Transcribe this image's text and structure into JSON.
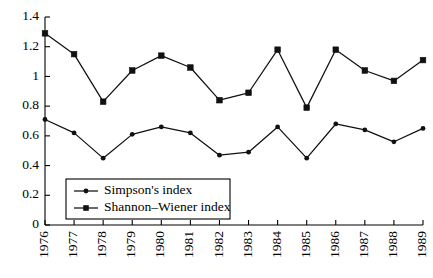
{
  "chart_data": {
    "type": "line",
    "title": "",
    "xlabel": "",
    "ylabel": "",
    "categories": [
      "1976",
      "1977",
      "1978",
      "1979",
      "1980",
      "1981",
      "1982",
      "1983",
      "1984",
      "1985",
      "1986",
      "1987",
      "1988",
      "1989"
    ],
    "ylim": [
      0,
      1.4
    ],
    "yticks": [
      0,
      0.2,
      0.4,
      0.6,
      0.8,
      1,
      1.2,
      1.4
    ],
    "ytick_labels": [
      "0",
      "0.2",
      "0.4",
      "0.6",
      "0.8",
      "1",
      "1.2",
      "1.4"
    ],
    "grid": false,
    "legend_position": "lower-left",
    "series": [
      {
        "name": "Simpson's index",
        "marker": "circle",
        "values": [
          0.71,
          0.62,
          0.45,
          0.61,
          0.66,
          0.62,
          0.47,
          0.49,
          0.66,
          0.45,
          0.68,
          0.64,
          0.56,
          0.65
        ]
      },
      {
        "name": "Shannon–Wiener index",
        "marker": "square",
        "values": [
          1.29,
          1.15,
          0.83,
          1.04,
          1.14,
          1.06,
          0.84,
          0.89,
          1.18,
          0.79,
          1.18,
          1.04,
          0.97,
          1.11
        ]
      }
    ]
  },
  "legend": {
    "items": [
      {
        "label": "Simpson's index"
      },
      {
        "label": "Shannon–Wiener index"
      }
    ]
  },
  "colors": {
    "axis": "#000000",
    "series": "#111111",
    "background": "#ffffff"
  }
}
